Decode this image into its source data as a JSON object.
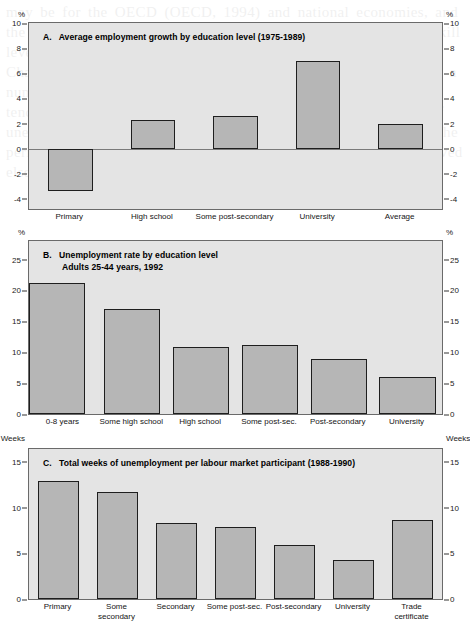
{
  "figure": {
    "background_color": "#ffffff",
    "plot_background_color": "#e4e4e4",
    "bar_fill_color": "#b6b6b6",
    "bar_edge_color": "#1e1e1e"
  },
  "panels": {
    "a": {
      "title": "A.   Average employment growth by education level (1975-1989)",
      "unit_left": "%",
      "unit_right": "%"
    },
    "b": {
      "title_line1": "B.   Unemployment rate by education level",
      "title_line2": "Adults 25-44 years, 1992",
      "unit_left": "%",
      "unit_right": "%"
    },
    "c": {
      "title": "C.   Total weeks of unemployment per labour market participant (1988-1990)",
      "unit_left": "Weeks",
      "unit_right": "Weeks"
    }
  },
  "chart_data": [
    {
      "id": "a",
      "type": "bar",
      "title": "A.   Average employment growth by education level (1975-1989)",
      "xlabel": "",
      "ylabel": "%",
      "ylim": [
        -4.8,
        10.0
      ],
      "yticks": [
        -4,
        -2,
        0,
        2,
        4,
        6,
        8,
        10
      ],
      "ytick_labels": [
        "-4",
        "-2",
        "0",
        "2",
        "4",
        "6",
        "8",
        "10"
      ],
      "grid": false,
      "legend": null,
      "categories": [
        "Primary",
        "High school",
        "Some post-secondary",
        "University",
        "Average"
      ],
      "values": [
        -3.4,
        2.3,
        2.6,
        7.0,
        2.0
      ]
    },
    {
      "id": "b",
      "type": "bar",
      "title": "B.   Unemployment rate by education level / Adults 25-44 years, 1992",
      "xlabel": "",
      "ylabel": "%",
      "ylim": [
        0,
        28.0
      ],
      "yticks": [
        0,
        5,
        10,
        15,
        20,
        25
      ],
      "ytick_labels": [
        "0",
        "5",
        "10",
        "15",
        "20",
        "25"
      ],
      "grid": false,
      "legend": null,
      "categories": [
        "0-8 years",
        "Some high school",
        "High school",
        "Some post-sec.",
        "Post-secondary",
        "University"
      ],
      "values": [
        21.2,
        17.0,
        10.8,
        11.1,
        8.9,
        6.0
      ]
    },
    {
      "id": "c",
      "type": "bar",
      "title": "C.   Total weeks of unemployment per labour market participant (1988-1990)",
      "xlabel": "",
      "ylabel": "Weeks",
      "ylim": [
        0,
        16.4
      ],
      "yticks": [
        0,
        5,
        10,
        15
      ],
      "ytick_labels": [
        "0",
        "5",
        "10",
        "15"
      ],
      "grid": false,
      "legend": null,
      "categories": [
        "Primary",
        "Some\nsecondary",
        "Secondary",
        "Some post-sec.",
        "Post-secondary",
        "University",
        "Trade\ncertificate"
      ],
      "values": [
        12.9,
        11.7,
        8.3,
        7.9,
        5.9,
        4.3,
        8.6
      ]
    }
  ],
  "background_text": "may be for the OECD (OECD, 1994) and national economies, and the policies of the 1980s have implied the wide dispersion of skill level and the small share of earnings for the educated workers. Chart 9 shows the relationship between the education levels and a number of labour market indicators for Canada, where the tendency for high school dropouts to experience longer spells of unemployment and lower employment growth is evident across the period studied. These findings confirm the general pattern observed elsewhere in the OECD area."
}
